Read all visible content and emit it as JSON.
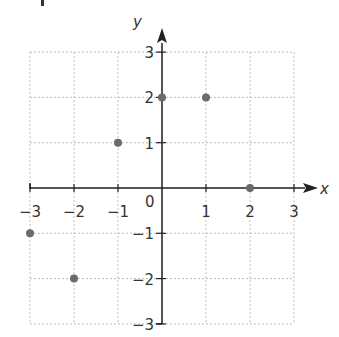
{
  "chart_data": {
    "type": "scatter",
    "title": "",
    "xlabel": "x",
    "ylabel": "y",
    "xlim": [
      -3,
      3
    ],
    "ylim": [
      -3,
      3
    ],
    "grid": true,
    "x_ticks": [
      -3,
      -2,
      -1,
      1,
      2,
      3
    ],
    "y_ticks": [
      3,
      2,
      1,
      -1,
      -2,
      -3
    ],
    "origin_label": "0",
    "points": [
      {
        "x": -3,
        "y": -1
      },
      {
        "x": -2,
        "y": -2
      },
      {
        "x": -1,
        "y": 1
      },
      {
        "x": 0,
        "y": 2
      },
      {
        "x": 1,
        "y": 2
      },
      {
        "x": 2,
        "y": 0
      }
    ],
    "colors": {
      "point": "#6b6b6b",
      "axis": "#222222",
      "grid": "#bdbdbd"
    }
  }
}
